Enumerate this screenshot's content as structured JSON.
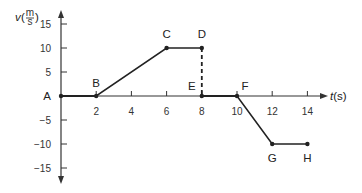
{
  "chart_data": {
    "type": "line",
    "title": "",
    "xlabel": "t(s)",
    "ylabel": "v(m/s)",
    "ylabel_parts": {
      "var": "v",
      "num": "m",
      "den": "s"
    },
    "xlim": [
      0,
      15
    ],
    "ylim": [
      -17,
      17
    ],
    "grid": false,
    "legend": null,
    "x_ticks": [
      2,
      4,
      6,
      8,
      10,
      12,
      14
    ],
    "x_tick_labels": [
      "2",
      "4",
      "6",
      "8",
      "10",
      "12",
      "14"
    ],
    "y_ticks": [
      15,
      10,
      5,
      -5,
      -10,
      -15
    ],
    "y_tick_labels": [
      "15",
      "10",
      "5",
      "−5",
      "−10",
      "−15"
    ],
    "points": [
      {
        "label": "A",
        "t": 0,
        "v": 0
      },
      {
        "label": "B",
        "t": 2,
        "v": 0
      },
      {
        "label": "C",
        "t": 6,
        "v": 10
      },
      {
        "label": "D",
        "t": 8,
        "v": 10
      },
      {
        "label": "E",
        "t": 8,
        "v": 0
      },
      {
        "label": "F",
        "t": 10,
        "v": 0
      },
      {
        "label": "G",
        "t": 12,
        "v": -10
      },
      {
        "label": "H",
        "t": 14,
        "v": -10
      }
    ],
    "series": [
      {
        "name": "A-B-C-D",
        "x": [
          0,
          2,
          6,
          8
        ],
        "y": [
          0,
          0,
          10,
          10
        ],
        "style": "solid"
      },
      {
        "name": "D-E",
        "x": [
          8,
          8
        ],
        "y": [
          10,
          0
        ],
        "style": "dashed"
      },
      {
        "name": "E-F-G-H",
        "x": [
          8,
          10,
          12,
          14
        ],
        "y": [
          0,
          0,
          -10,
          -10
        ],
        "style": "solid"
      }
    ],
    "colors": {
      "line": "#222222",
      "axis": "#333333"
    }
  }
}
